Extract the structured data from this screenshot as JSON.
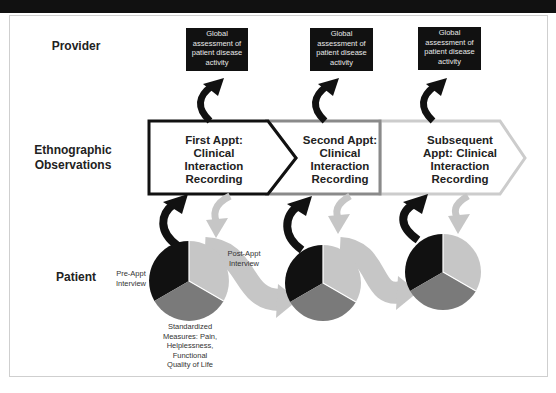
{
  "figure": {
    "rows": {
      "provider": "Provider",
      "ethnographic_line1": "Ethnographic",
      "ethnographic_line2": "Observations",
      "patient": "Patient"
    },
    "provider_boxes": [
      {
        "lines": [
          "Global",
          "assessment of",
          "patient disease",
          "activity"
        ]
      },
      {
        "lines": [
          "Global",
          "assessment of",
          "patient disease",
          "activity"
        ]
      },
      {
        "lines": [
          "Global",
          "assessment of",
          "patient disease",
          "activity"
        ]
      }
    ],
    "appointments": [
      {
        "lines": [
          "First Appt:",
          "Clinical",
          "Interaction",
          "Recording"
        ],
        "border_color": "#111111"
      },
      {
        "lines": [
          "Second Appt:",
          "Clinical",
          "Interaction",
          "Recording"
        ],
        "border_color": "#8a8a8a"
      },
      {
        "lines": [
          "Subsequent",
          "Appt: Clinical",
          "Interaction",
          "Recording"
        ],
        "border_color": "#cccccc"
      }
    ],
    "patient_labels": {
      "pre_appt": [
        "Pre-Appt",
        "Interview"
      ],
      "post_appt": [
        "Post-Appt",
        "Interview"
      ],
      "standardized": [
        "Standardized",
        "Measures: Pain,",
        "Helplessness,",
        "Functional",
        "Quality of Life"
      ]
    },
    "pie_segments": [
      {
        "name": "Pre-Appt Interview",
        "color": "#111111"
      },
      {
        "name": "Standardized Measures",
        "color": "#7a7a7a"
      },
      {
        "name": "Post-Appt Interview",
        "color": "#c6c6c6"
      }
    ],
    "colors": {
      "black": "#111111",
      "dark_gray": "#7a7a7a",
      "light_gray": "#c6c6c6",
      "mid_gray_border": "#8a8a8a"
    }
  }
}
